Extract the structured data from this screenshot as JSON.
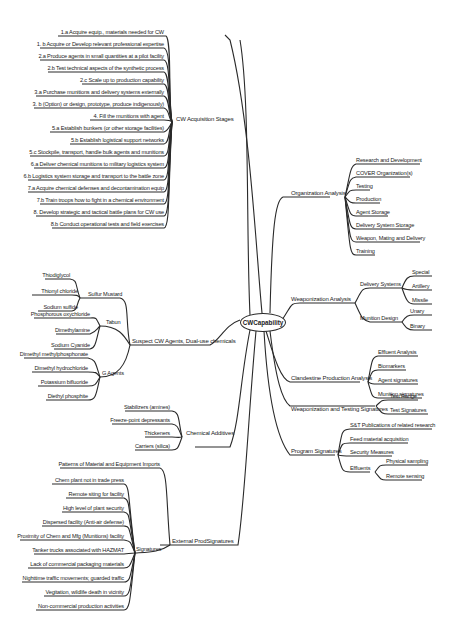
{
  "root": {
    "label": "CWCapability"
  },
  "left": {
    "acquisition": {
      "label": "CW Acquisition Stages",
      "items": [
        "1.a  Acquire equip., materials needed for CW",
        "1. b  Acquire or Develop relevant professional expertise",
        "2.a Produce agents in small quantities at a pilot facility",
        "2.b Test technical aspects of the synthetic process",
        "2.c Scale up to production capability",
        "3.a Purchase munitions and delivery systems externally",
        "3. b (Option) or design, prototype,  produce  indigenously)",
        "4. Fill the munitions with agent",
        "5.a Establish bunkers (or other storage facilities)",
        "5.b Establish logistical support networks",
        "5.c Stockpile, transport, handle bulk agents and munitions",
        "6.a Deliver chemical munitions to military logistics system",
        "6.b  Logistics system storage and transport to the battle zone",
        "7.a Acquire chemical defenses and decontamination equip",
        "7.b Train troops how to fight in a chemical environment",
        "8.  Develop strategic and tactical battle plans for CW use",
        "8.b Conduct operational tests and field exercises"
      ]
    },
    "agents": {
      "label": "Suspect CW Agents, Dual-use chemicals",
      "groups": [
        {
          "label": "Sulfur Mustard",
          "items": [
            "Thiodiglycol",
            "Thionyl chloride",
            "Sodium sulfide"
          ]
        },
        {
          "label": "Tabun",
          "items": [
            "Phosphorous oxychloride",
            "Dimethylamine",
            "Sodium Cyanide"
          ]
        },
        {
          "label": "G Agents",
          "items": [
            "Dimethyl methylphosphonate",
            "Dimethyl hydrochloride",
            "Potassium bifluoride",
            "Diethyl phosphite"
          ]
        }
      ]
    },
    "additives": {
      "label": "Chemical Additives",
      "items": [
        "Stabilizers (amines)",
        "Freeze-point depressants",
        "Thickeners",
        "Carriers (silica)"
      ]
    },
    "external": {
      "label": "External ProdSignatures",
      "patterns": "Patterns of Material and Equipment Imports",
      "signatures": {
        "label": "Signatures",
        "items": [
          "Chem plant not in trade press",
          "Remote siting for facility",
          "High level of plant security",
          "Dispersed facility (Anti-air defense)",
          "Proximity of Chem and Mfg (Munitions) facility",
          "Tanker trucks associated with HAZMAT",
          "Lack of commercial packaging materials",
          "Nighttime traffic movements; guarded traffic",
          "Vegitation, wildlife death in vicinity",
          "Non-commercial production activities"
        ]
      }
    }
  },
  "right": {
    "organization": {
      "label": "Organization Analysis",
      "items": [
        "Research and Development",
        "COVER Organization(s)",
        "Testing",
        "Production",
        "Agent Storage",
        "Delivery System Storage",
        "Weapon, Mating and Delivery",
        "Training"
      ]
    },
    "weaponization": {
      "label": "Weaponization Analysis",
      "delivery": {
        "label": "Delivery Systems",
        "items": [
          "Special",
          "Artillery",
          "Missile"
        ]
      },
      "munition": {
        "label": "Munition Design",
        "items": [
          "Unary",
          "Binary"
        ]
      }
    },
    "clandestine": {
      "label": "Clandestine Production Analysis",
      "items": [
        "Effluent Analysis",
        "Biomarkers",
        "Agent signatures",
        "Munition signatures"
      ]
    },
    "testing": {
      "label": "Weaponization and Testing Signatures",
      "items": [
        "Test Range",
        "Test  Signatures"
      ]
    },
    "program": {
      "label": "Program Signatures",
      "items": [
        "S&T Publications of related research",
        "Feed material acquisition",
        "Security Measures"
      ],
      "effluents": {
        "label": "Effluents",
        "items": [
          "Physical sampling",
          "Remote sensing"
        ]
      }
    }
  }
}
